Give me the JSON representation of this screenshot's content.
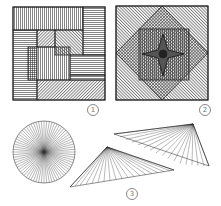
{
  "figures": [
    {
      "id": "figure-1",
      "label": "1",
      "description": "square composed of rectangular hatched blocks (vertical, horizontal, diagonal lines)"
    },
    {
      "id": "figure-2",
      "label": "2",
      "description": "nested square and diamond with diagonal hatching and four-point star center"
    },
    {
      "id": "figure-3",
      "label": "3",
      "description": "line drawings: radial circle and two fan-lined triangles"
    }
  ],
  "colors": {
    "ink": "#2a2a2a",
    "background": "#ffffff",
    "label": "#888888"
  }
}
